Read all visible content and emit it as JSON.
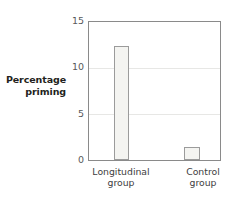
{
  "chart_data": {
    "type": "bar",
    "title": "",
    "xlabel": "",
    "ylabel": "Percentage priming",
    "categories": [
      "Longitudinal group",
      "Control group"
    ],
    "values": [
      12.4,
      1.4
    ],
    "ylim": [
      0,
      15
    ],
    "yticks": [
      0,
      5,
      10,
      15
    ],
    "ytick_labels": [
      "0",
      "5",
      "10",
      "15"
    ],
    "grid": true,
    "gridlines_at": [
      5,
      10
    ],
    "legend": "none",
    "bar_fill": "#f4f4f1",
    "bar_stroke": "#9b9b9b",
    "frame_stroke": "#8a8a8a",
    "grid_color": "#e7e7e5",
    "tick_label_color": "#58595b",
    "axis_title_color": "#231f20"
  },
  "axis": {
    "y_title_line1": "Percentage",
    "y_title_line2": "priming"
  },
  "categories": [
    {
      "line1": "Longitudinal",
      "line2": "group"
    },
    {
      "line1": "Control",
      "line2": "group"
    }
  ],
  "ticks": [
    {
      "label": "15"
    },
    {
      "label": "10"
    },
    {
      "label": "5"
    },
    {
      "label": "0"
    }
  ]
}
